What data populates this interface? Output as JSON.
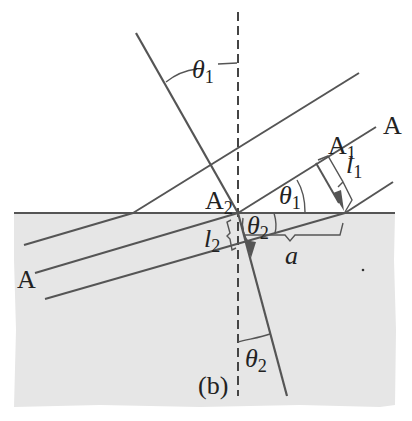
{
  "figure": {
    "caption": "(b)",
    "colors": {
      "medium_fill": "#e6e6e6",
      "line": "#555555",
      "text": "#222222",
      "background": "#ffffff"
    },
    "labels": {
      "theta1_top": {
        "base": "θ",
        "sub": "1"
      },
      "theta1_mid": {
        "base": "θ",
        "sub": "1"
      },
      "theta2_mid": {
        "base": "θ",
        "sub": "2"
      },
      "theta2_bottom": {
        "base": "θ",
        "sub": "2"
      },
      "A_right": "A",
      "A_left": "A",
      "A1": {
        "base": "A",
        "sub": "1"
      },
      "A2": {
        "base": "A",
        "sub": "2"
      },
      "l1": {
        "base": "l",
        "sub": "1"
      },
      "l2": {
        "base": "l",
        "sub": "2"
      },
      "a": "a"
    }
  }
}
